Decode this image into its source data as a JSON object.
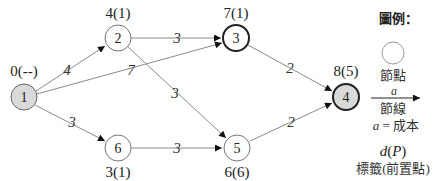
{
  "diagram": {
    "type": "shortest-path network (Dijkstra)",
    "nodes": [
      {
        "id": "1",
        "label": "1",
        "dlabel": "0(--)",
        "x": 24,
        "y": 97,
        "fill": "#d9d9d9",
        "bold": false
      },
      {
        "id": "2",
        "label": "2",
        "dlabel": "4(1)",
        "x": 118,
        "y": 38,
        "fill": "#ffffff",
        "bold": false
      },
      {
        "id": "3",
        "label": "3",
        "dlabel": "7(1)",
        "x": 236,
        "y": 38,
        "fill": "#ffffff",
        "bold": true
      },
      {
        "id": "4",
        "label": "4",
        "dlabel": "8(5)",
        "x": 346,
        "y": 97,
        "fill": "#d9d9d9",
        "bold": true
      },
      {
        "id": "5",
        "label": "5",
        "dlabel": "6(6)",
        "x": 237,
        "y": 148,
        "fill": "#ffffff",
        "bold": false
      },
      {
        "id": "6",
        "label": "6",
        "dlabel": "3(1)",
        "x": 118,
        "y": 148,
        "fill": "#ffffff",
        "bold": false
      }
    ],
    "edges": [
      {
        "from": "1",
        "to": "2",
        "cost": "4"
      },
      {
        "from": "1",
        "to": "3",
        "cost": "7"
      },
      {
        "from": "1",
        "to": "6",
        "cost": "3"
      },
      {
        "from": "2",
        "to": "3",
        "cost": "3"
      },
      {
        "from": "2",
        "to": "5",
        "cost": "3"
      },
      {
        "from": "6",
        "to": "5",
        "cost": "3"
      },
      {
        "from": "3",
        "to": "4",
        "cost": "2"
      },
      {
        "from": "5",
        "to": "4",
        "cost": "2"
      }
    ],
    "labels": {
      "n1": "1",
      "n2": "2",
      "n3": "3",
      "n4": "4",
      "n5": "5",
      "n6": "6",
      "d1": "0(--)",
      "d2": "4(1)",
      "d3": "7(1)",
      "d4": "8(5)",
      "d5": "6(6)",
      "d6": "3(1)",
      "e12": "4",
      "e13": "7",
      "e16": "3",
      "e23": "3",
      "e25": "3",
      "e65": "3",
      "e34": "2",
      "e54": "2"
    }
  },
  "legend": {
    "title": "圖例：",
    "node_caption": "節點",
    "arc_symbol": "a",
    "arc_caption": "節線",
    "cost_def_var": "a",
    "cost_def_text": " = 成本",
    "label_formula_d": "d",
    "label_formula_paren": "(",
    "label_formula_p": "P",
    "label_formula_close": ")",
    "label_caption": "標籤(前置點)"
  },
  "colors": {
    "edge": "#8a8a8a",
    "arrow": "#111111",
    "start_end_fill": "#d9d9d9",
    "node_stroke": "#555555",
    "bold_stroke": "#222222"
  }
}
